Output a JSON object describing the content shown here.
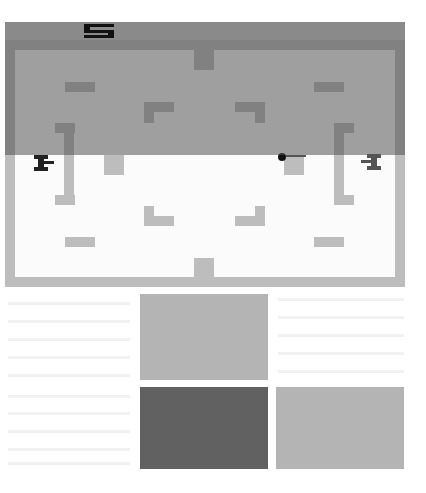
{
  "game": {
    "title": "Combat",
    "score": {
      "left_player": "5"
    },
    "colors": {
      "wall": "#bdbdbd",
      "wall_dark": "#646464",
      "field": "#ffffff",
      "score_band": "#8a8a8a",
      "score_digit": "#111111",
      "tank_left": "#222222",
      "tank_right": "#555555",
      "bullet": "#111111"
    },
    "entities": {
      "left_tank": {
        "name": "player-1-tank",
        "facing": "right"
      },
      "right_tank": {
        "name": "player-2-tank",
        "facing": "left"
      },
      "bullet": {
        "name": "projectile"
      }
    }
  },
  "swatches": [
    {
      "name": "light-gray-swatch",
      "color": "#b4b4b4"
    },
    {
      "name": "dark-gray-swatch",
      "color": "#616161"
    },
    {
      "name": "light-gray-swatch-2",
      "color": "#b4b4b4"
    }
  ]
}
